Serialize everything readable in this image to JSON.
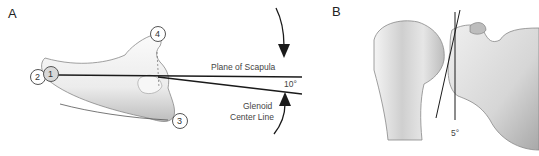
{
  "panels": {
    "a": {
      "label": "A",
      "landmarks": [
        "1",
        "2",
        "3",
        "4"
      ],
      "plane_label": "Plane of Scapula",
      "glenoid_label_line1": "Glenoid",
      "glenoid_label_line2": "Center Line",
      "angle": "10°"
    },
    "b": {
      "label": "B",
      "angle": "5°"
    }
  },
  "colors": {
    "line": "#1a1a1a",
    "bone_fill": "#f0f0f0",
    "bone_shade": "#c8c8c8",
    "text": "#444444"
  }
}
